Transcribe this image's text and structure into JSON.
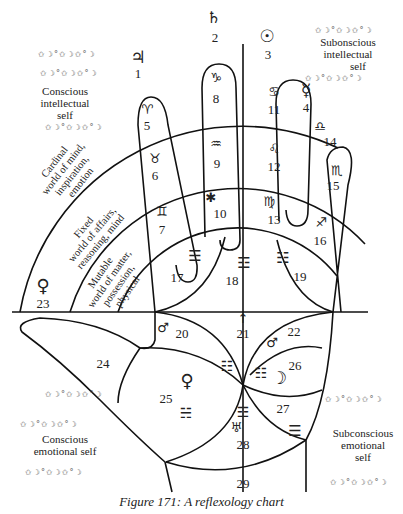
{
  "caption": "Figure 171: A reflexology chart",
  "corner_notes": {
    "top_left": [
      "Conscious",
      "intellectual",
      "self"
    ],
    "top_right": [
      "Subonscious",
      "intellectual",
      "self"
    ],
    "bottom_left": [
      "Conscious",
      "emotional self"
    ],
    "bottom_right": [
      "Subconscious",
      "emotional",
      "self"
    ]
  },
  "arc_bands": {
    "cardinal": [
      "Cardinal",
      "world of mind,",
      "inspiration,",
      "emotion"
    ],
    "fixed": [
      "Fixed",
      "world of affairs,",
      "reasoning, mind"
    ],
    "mutable": [
      "Mutable",
      "world of matter,",
      "possession,",
      "physical"
    ]
  },
  "zones": [
    {
      "num": "1",
      "symbol": "♃",
      "meaning": "jupiter"
    },
    {
      "num": "2",
      "symbol": "♄",
      "meaning": "saturn"
    },
    {
      "num": "3",
      "symbol": "☉",
      "meaning": "sun"
    },
    {
      "num": "4",
      "symbol": "☿",
      "meaning": "mercury"
    },
    {
      "num": "5",
      "symbol": "♈",
      "meaning": "aries"
    },
    {
      "num": "6",
      "symbol": "♉",
      "meaning": "taurus"
    },
    {
      "num": "7",
      "symbol": "♊",
      "meaning": "gemini"
    },
    {
      "num": "8",
      "symbol": "♑",
      "meaning": "capricorn"
    },
    {
      "num": "9",
      "symbol": "♒",
      "meaning": "aquarius"
    },
    {
      "num": "10",
      "symbol": "✱",
      "meaning": "pisces"
    },
    {
      "num": "11",
      "symbol": "♋",
      "meaning": "cancer"
    },
    {
      "num": "12",
      "symbol": "♌",
      "meaning": "leo"
    },
    {
      "num": "13",
      "symbol": "♍",
      "meaning": "virgo"
    },
    {
      "num": "14",
      "symbol": "♎",
      "meaning": "libra"
    },
    {
      "num": "15",
      "symbol": "♏",
      "meaning": "scorpio"
    },
    {
      "num": "16",
      "symbol": "♐",
      "meaning": "sagittarius"
    },
    {
      "num": "17",
      "symbol": "☰",
      "meaning": "trigram"
    },
    {
      "num": "18",
      "symbol": "☲",
      "meaning": "trigram"
    },
    {
      "num": "19",
      "symbol": "☷",
      "meaning": "trigram"
    },
    {
      "num": "20",
      "symbol": "♂",
      "meaning": "mars"
    },
    {
      "num": "21",
      "symbol": "↑",
      "meaning": "arrow"
    },
    {
      "num": "22",
      "symbol": "♂",
      "meaning": "mars"
    },
    {
      "num": "23",
      "symbol": "♀",
      "meaning": "venus"
    },
    {
      "num": "24",
      "symbol": "",
      "meaning": ""
    },
    {
      "num": "25",
      "symbol": "♀",
      "meaning": "venus"
    },
    {
      "num": "26",
      "symbol": "☽",
      "meaning": "moon"
    },
    {
      "num": "27",
      "symbol": "☰",
      "meaning": "trigram"
    },
    {
      "num": "28",
      "symbol": "♅",
      "meaning": "uranus"
    },
    {
      "num": "29",
      "symbol": "",
      "meaning": ""
    }
  ],
  "trigrams": {
    "t17": "☰",
    "t18": "☲",
    "t19": "☷",
    "t25a": "☷",
    "t25b": "☵",
    "t26": "☷",
    "t28": "☲",
    "t27": "☰"
  },
  "deco": "✩☽°✩☽✩°☽"
}
